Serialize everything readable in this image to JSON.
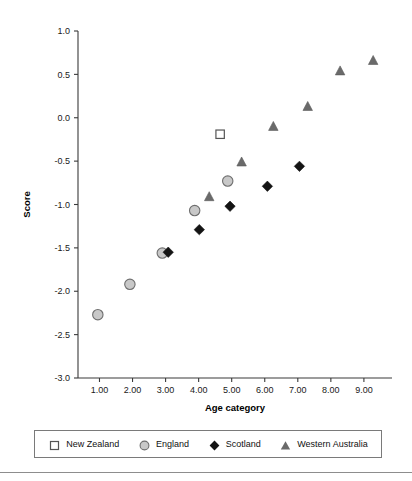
{
  "chart_data": {
    "type": "scatter",
    "title": "",
    "xlabel": "Age category",
    "ylabel": "Score",
    "xlim": [
      0.35,
      9.85
    ],
    "ylim": [
      -3.0,
      1.0
    ],
    "grid": false,
    "legend_position": "bottom",
    "xticks": [
      "1.00",
      "2.00",
      "3.00",
      "4.00",
      "5.00",
      "6.00",
      "7.00",
      "8.00",
      "9.00"
    ],
    "xtick_values": [
      1,
      2,
      3,
      4,
      5,
      6,
      7,
      8,
      9
    ],
    "yticks": [
      "1.0",
      "0.5",
      "0.0",
      "-0.5",
      "-1.0",
      "-1.5",
      "-2.0",
      "-2.5",
      "-3.0"
    ],
    "ytick_values": [
      1.0,
      0.5,
      0.0,
      -0.5,
      -1.0,
      -1.5,
      -2.0,
      -2.5,
      -3.0
    ],
    "series": [
      {
        "name": "New Zealand",
        "marker": "open-square",
        "color": "#ffffff",
        "edge_color": "#555555",
        "points": [
          {
            "x": 4.65,
            "y": -0.19
          }
        ]
      },
      {
        "name": "England",
        "marker": "filled-circle",
        "color": "#c8c8c8",
        "edge_color": "#6e6e6e",
        "points": [
          {
            "x": 0.95,
            "y": -2.27
          },
          {
            "x": 1.92,
            "y": -1.92
          },
          {
            "x": 2.9,
            "y": -1.56
          },
          {
            "x": 3.88,
            "y": -1.07
          },
          {
            "x": 4.88,
            "y": -0.73
          }
        ]
      },
      {
        "name": "Scotland",
        "marker": "filled-diamond",
        "color": "#141414",
        "edge_color": "#141414",
        "points": [
          {
            "x": 3.08,
            "y": -1.55
          },
          {
            "x": 4.02,
            "y": -1.29
          },
          {
            "x": 4.95,
            "y": -1.02
          },
          {
            "x": 6.08,
            "y": -0.79
          },
          {
            "x": 7.05,
            "y": -0.56
          }
        ]
      },
      {
        "name": "Western Australia",
        "marker": "filled-triangle",
        "color": "#6a6a6a",
        "edge_color": "#5a5a5a",
        "points": [
          {
            "x": 4.32,
            "y": -0.91
          },
          {
            "x": 5.3,
            "y": -0.51
          },
          {
            "x": 6.26,
            "y": -0.1
          },
          {
            "x": 7.3,
            "y": 0.13
          },
          {
            "x": 8.28,
            "y": 0.54
          },
          {
            "x": 9.28,
            "y": 0.66
          }
        ]
      }
    ]
  },
  "legend": {
    "items": [
      {
        "label": "New Zealand",
        "marker": "open-square-icon"
      },
      {
        "label": "England",
        "marker": "gray-circle-icon"
      },
      {
        "label": "Scotland",
        "marker": "black-diamond-icon"
      },
      {
        "label": "Western Australia",
        "marker": "gray-triangle-icon"
      }
    ]
  }
}
